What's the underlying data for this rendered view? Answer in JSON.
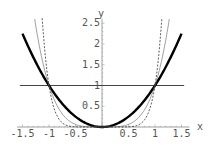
{
  "chart_data": {
    "type": "line",
    "title": "",
    "xlabel": "x",
    "ylabel": "y",
    "xlim": [
      -1.5,
      1.5
    ],
    "ylim": [
      0,
      2.6
    ],
    "grid": false,
    "x_ticks": [
      "-1.5",
      "-1",
      "-0.5",
      "0.5",
      "1",
      "1.5"
    ],
    "y_ticks": [
      "0.5",
      "1",
      "1.5",
      "2",
      "2.5"
    ],
    "series": [
      {
        "name": "y = 1",
        "style": "solid-medium",
        "function": "1",
        "x": [
          -1.55,
          1.55
        ],
        "values": [
          1,
          1
        ]
      },
      {
        "name": "y = x^2",
        "style": "solid-thick",
        "function": "x^2",
        "x": [
          -1.5,
          -1,
          -0.5,
          0,
          0.5,
          1,
          1.5
        ],
        "values": [
          2.25,
          1,
          0.25,
          0,
          0.25,
          1,
          2.25
        ]
      },
      {
        "name": "y = x^4",
        "style": "solid-thin",
        "function": "x^4",
        "x": [
          -1.27,
          -1,
          -0.5,
          0,
          0.5,
          1,
          1.27
        ],
        "values": [
          2.6,
          1,
          0.0625,
          0,
          0.0625,
          1,
          2.6
        ]
      },
      {
        "name": "y = x^8",
        "style": "dashed",
        "function": "x^8",
        "x": [
          -1.13,
          -1,
          -0.5,
          0,
          0.5,
          1,
          1.13
        ],
        "values": [
          2.6,
          1,
          0.0039,
          0,
          0.0039,
          1,
          2.6
        ]
      }
    ]
  }
}
